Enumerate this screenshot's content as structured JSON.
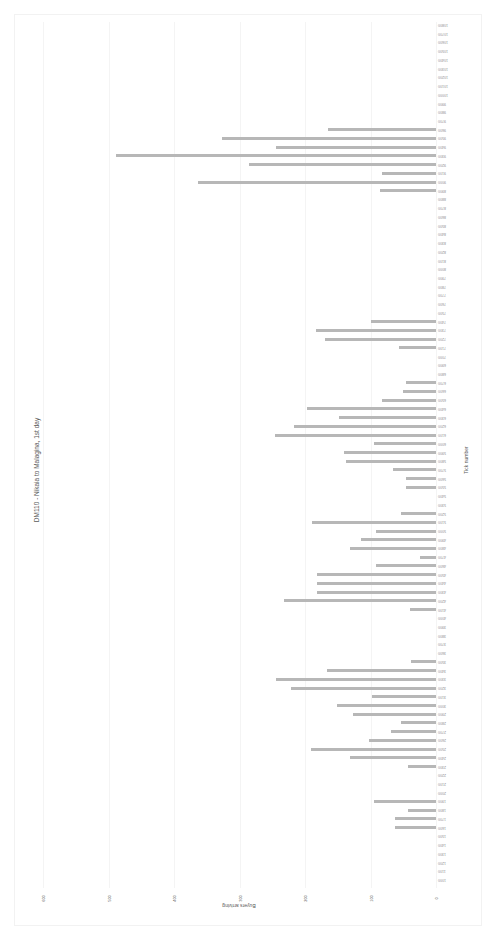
{
  "chart_data": {
    "type": "bar",
    "orientation": "horizontal (rotated 90°)",
    "title": "DM110 - Nikaia to Malagina, 1st day",
    "xlabel": "Tick number",
    "ylabel": "Buyers arriving",
    "ylim": [
      0,
      600
    ],
    "yticks": [
      0,
      100,
      200,
      300,
      400,
      500,
      600
    ],
    "grid": true,
    "bar_color": "#b7b7b7",
    "categories": [
      1000,
      1100,
      1200,
      1300,
      1400,
      1500,
      1600,
      1700,
      1800,
      1900,
      2000,
      2100,
      2200,
      2300,
      2400,
      2500,
      2600,
      2700,
      2800,
      2900,
      3000,
      3100,
      3200,
      3300,
      3400,
      3500,
      3600,
      3700,
      3800,
      3900,
      4000,
      4100,
      4200,
      4300,
      4400,
      4500,
      4600,
      4700,
      4800,
      4900,
      5000,
      5100,
      5200,
      5300,
      5400,
      5500,
      5600,
      5700,
      5800,
      5900,
      6000,
      6100,
      6200,
      6300,
      6400,
      6500,
      6600,
      6700,
      6800,
      6900,
      7000,
      7100,
      7200,
      7300,
      7400,
      7500,
      7600,
      7700,
      7800,
      7900,
      8000,
      8100,
      8200,
      8300,
      8400,
      8500,
      8600,
      8700,
      8800,
      8900,
      9000,
      9100,
      9200,
      9300,
      9400,
      9500,
      9600,
      9700,
      9800,
      9900,
      10000,
      10100,
      10200,
      10300,
      10400,
      10500,
      10600,
      10700,
      10800
    ],
    "values": [
      0,
      0,
      0,
      0,
      0,
      0,
      63,
      63,
      43,
      94,
      0,
      0,
      0,
      43,
      132,
      191,
      103,
      69,
      54,
      126,
      151,
      98,
      222,
      245,
      166,
      38,
      0,
      0,
      0,
      0,
      0,
      40,
      232,
      182,
      182,
      182,
      91,
      25,
      131,
      115,
      91,
      189,
      54,
      0,
      0,
      46,
      46,
      65,
      137,
      140,
      95,
      246,
      217,
      148,
      197,
      82,
      51,
      46,
      0,
      0,
      0,
      57,
      169,
      183,
      100,
      0,
      0,
      0,
      0,
      0,
      0,
      0,
      0,
      0,
      0,
      0,
      0,
      0,
      0,
      85,
      363,
      82,
      285,
      488,
      245,
      326,
      165,
      0,
      0,
      0,
      0,
      0,
      0,
      0,
      0,
      0,
      0,
      0,
      0
    ]
  }
}
